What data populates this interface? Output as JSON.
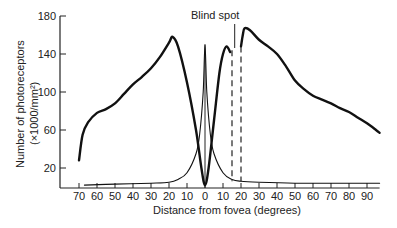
{
  "chart_data": {
    "type": "line",
    "title": "",
    "annotation": "Blind spot",
    "xlabel": "Distance from fovea (degrees)",
    "ylabel_line1": "Number of photoreceptors",
    "ylabel_line2": "(×1000/mm²)",
    "x_ticks": [
      70,
      60,
      50,
      40,
      30,
      20,
      10,
      0,
      10,
      20,
      30,
      40,
      50,
      60,
      70,
      80,
      90
    ],
    "x_tick_positions_deg": [
      -70,
      -60,
      -50,
      -40,
      -30,
      -20,
      -10,
      0,
      10,
      20,
      30,
      40,
      50,
      60,
      70,
      80,
      90
    ],
    "y_ticks": [
      20,
      60,
      100,
      140,
      180
    ],
    "ylim": [
      0,
      180
    ],
    "xlim": [
      -75,
      97
    ],
    "blind_spot_deg": [
      15,
      20
    ],
    "grid": false,
    "series": [
      {
        "name": "Rods",
        "style": "thick",
        "x": [
          -70,
          -68,
          -65,
          -60,
          -55,
          -50,
          -45,
          -40,
          -35,
          -30,
          -25,
          -20,
          -18,
          -15,
          -10,
          -5,
          -2,
          0,
          2,
          5,
          8,
          10,
          12,
          14
        ],
        "y": [
          28,
          55,
          68,
          78,
          82,
          88,
          98,
          108,
          116,
          125,
          137,
          152,
          158,
          148,
          110,
          60,
          20,
          2,
          20,
          70,
          120,
          140,
          148,
          142
        ]
      },
      {
        "name": "Rods (temporal)",
        "style": "thick",
        "x": [
          20,
          21,
          22,
          25,
          30,
          35,
          40,
          45,
          50,
          55,
          60,
          65,
          70,
          75,
          80,
          85,
          90,
          95,
          97
        ],
        "y": [
          148,
          160,
          167,
          165,
          155,
          148,
          140,
          127,
          112,
          103,
          96,
          92,
          88,
          83,
          79,
          73,
          67,
          60,
          57
        ]
      },
      {
        "name": "Cones",
        "style": "thin",
        "x": [
          -67,
          -50,
          -30,
          -20,
          -15,
          -10,
          -5,
          -3,
          -1,
          0,
          1,
          3,
          5,
          10,
          15,
          20,
          30,
          50,
          70,
          90,
          97
        ],
        "y": [
          2,
          3,
          4,
          5,
          8,
          15,
          35,
          55,
          100,
          150,
          100,
          55,
          35,
          15,
          8,
          6,
          5,
          4,
          4,
          4,
          4
        ]
      }
    ]
  }
}
